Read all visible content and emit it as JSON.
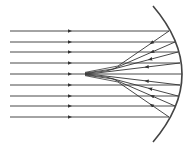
{
  "diagram": {
    "type": "ray-diagram",
    "colors": {
      "ray": "#333333",
      "mirror": "#444444",
      "background": "#ffffff"
    },
    "mirror": {
      "type": "concave",
      "top": [
        153,
        6
      ],
      "apex": [
        182,
        74
      ],
      "bottom": [
        153,
        142
      ]
    },
    "axis_y": 74,
    "incident_rays": [
      {
        "y": 31,
        "hit_x": 169,
        "reflect_to": [
          118,
          66
        ]
      },
      {
        "y": 42,
        "hit_x": 175,
        "reflect_to": [
          113,
          69
        ]
      },
      {
        "y": 52,
        "hit_x": 178,
        "reflect_to": [
          106,
          71
        ]
      },
      {
        "y": 63,
        "hit_x": 180,
        "reflect_to": [
          97,
          73
        ]
      },
      {
        "y": 74,
        "hit_x": 182,
        "reflect_to": [
          88,
          74
        ]
      },
      {
        "y": 85,
        "hit_x": 180,
        "reflect_to": [
          97,
          75
        ]
      },
      {
        "y": 96,
        "hit_x": 178,
        "reflect_to": [
          106,
          77
        ]
      },
      {
        "y": 106,
        "hit_x": 175,
        "reflect_to": [
          113,
          79
        ]
      },
      {
        "y": 117,
        "hit_x": 169,
        "reflect_to": [
          118,
          82
        ]
      }
    ],
    "ray_start_x": 10,
    "arrow_x": 70
  }
}
